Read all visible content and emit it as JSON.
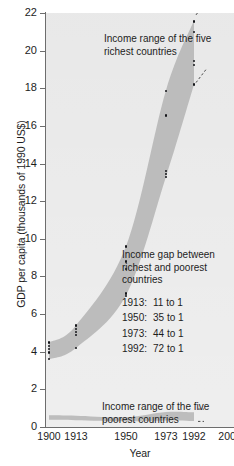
{
  "chart_data": {
    "type": "area",
    "title": "",
    "xlabel": "Year",
    "ylabel": "GDP per capita (thousands of 1990 US$)",
    "xlim": [
      1900,
      2004
    ],
    "ylim": [
      0,
      22
    ],
    "ytick_labels": [
      "0",
      "2",
      "4",
      "6",
      "8",
      "10",
      "12",
      "14",
      "16",
      "18",
      "20",
      "22"
    ],
    "ytick_values": [
      0,
      2,
      4,
      6,
      8,
      10,
      12,
      14,
      16,
      18,
      20,
      22
    ],
    "xtick_labels": [
      "1900",
      "1913",
      "1950",
      "1973",
      "1992",
      "2000"
    ],
    "xtick_values": [
      1900,
      1913,
      1950,
      1973,
      1992,
      2000
    ],
    "grid": false,
    "legend_position": "none",
    "series": [
      {
        "name": "Income range of the five richest countries",
        "type": "band",
        "x": [
          1900,
          1913,
          1950,
          1973,
          1992
        ],
        "upper": [
          4.5,
          5.4,
          9.6,
          17.9,
          21.6
        ],
        "lower": [
          3.6,
          4.2,
          7.0,
          13.3,
          18.2
        ]
      },
      {
        "name": "Income range of the five poorest countries",
        "type": "band",
        "x": [
          1900,
          1913,
          1950,
          1973,
          1992
        ],
        "upper": [
          0.62,
          0.6,
          0.52,
          0.8,
          0.78
        ],
        "lower": [
          0.38,
          0.36,
          0.3,
          0.35,
          0.32
        ]
      }
    ],
    "points": [
      {
        "x": 1900,
        "y": 4.5
      },
      {
        "x": 1900,
        "y": 4.3
      },
      {
        "x": 1900,
        "y": 4.15
      },
      {
        "x": 1900,
        "y": 3.95
      },
      {
        "x": 1900,
        "y": 3.6
      },
      {
        "x": 1913,
        "y": 5.4
      },
      {
        "x": 1913,
        "y": 5.2
      },
      {
        "x": 1913,
        "y": 5.05
      },
      {
        "x": 1913,
        "y": 4.9
      },
      {
        "x": 1913,
        "y": 4.2
      },
      {
        "x": 1950,
        "y": 9.6
      },
      {
        "x": 1950,
        "y": 8.8
      },
      {
        "x": 1950,
        "y": 8.4
      },
      {
        "x": 1950,
        "y": 7.1
      },
      {
        "x": 1950,
        "y": 6.95
      },
      {
        "x": 1973,
        "y": 17.85
      },
      {
        "x": 1973,
        "y": 16.55
      },
      {
        "x": 1973,
        "y": 13.6
      },
      {
        "x": 1973,
        "y": 13.45
      },
      {
        "x": 1973,
        "y": 13.3
      },
      {
        "x": 1992,
        "y": 21.55
      },
      {
        "x": 1992,
        "y": 21.0
      },
      {
        "x": 1992,
        "y": 19.45
      },
      {
        "x": 1992,
        "y": 19.25
      },
      {
        "x": 1992,
        "y": 18.2
      }
    ],
    "annotations": {
      "rich_band": "Income range of the five richest countries",
      "poor_band": "Income range of the five poorest countries",
      "gap_heading": "Income gap between richest and poorest countries",
      "gap_rows": [
        {
          "year": "1913:",
          "ratio": "11 to 1"
        },
        {
          "year": "1950:",
          "ratio": "35 to 1"
        },
        {
          "year": "1973:",
          "ratio": "44 to 1"
        },
        {
          "year": "1992:",
          "ratio": "72 to 1"
        }
      ]
    },
    "colors": {
      "band": "#b9b9b9",
      "plot_background": "#e6e6e6",
      "axis": "#6d6d6d",
      "text": "#1d1d1d",
      "point": "#15161a"
    }
  }
}
